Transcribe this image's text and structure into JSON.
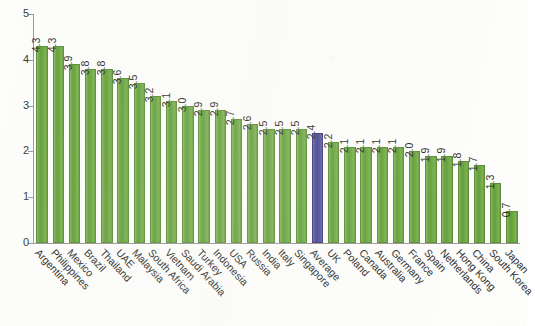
{
  "chart_data": {
    "type": "bar",
    "title": "",
    "subtitle": "",
    "xlabel": "",
    "ylabel": "",
    "ylim": [
      0,
      5
    ],
    "yticks": [
      "0",
      "1",
      "2",
      "3",
      "4",
      "5"
    ],
    "grid": false,
    "legend": "none",
    "categories": [
      "Argentina",
      "Philippines",
      "Mexico",
      "Brazil",
      "Thailand",
      "UAE",
      "Malaysia",
      "South Africa",
      "Vietnam",
      "Saudi Arabia",
      "Turkey",
      "Indonesia",
      "USA",
      "Russia",
      "India",
      "Italy",
      "Singapore",
      "Average",
      "UK",
      "Poland",
      "Canada",
      "Australia",
      "Germany",
      "France",
      "Spain",
      "Netherlands",
      "Hong Kong",
      "China",
      "South Korea",
      "Japan"
    ],
    "values": [
      4.3,
      4.3,
      3.9,
      3.8,
      3.8,
      3.6,
      3.5,
      3.2,
      3.1,
      3.0,
      2.9,
      2.9,
      2.7,
      2.6,
      2.5,
      2.5,
      2.5,
      2.4,
      2.2,
      2.1,
      2.1,
      2.1,
      2.1,
      2.0,
      1.9,
      1.9,
      1.8,
      1.7,
      1.3,
      0.7
    ],
    "value_labels": [
      "4.3",
      "4.3",
      "3.9",
      "3.8",
      "3.8",
      "3.6",
      "3.5",
      "3.2",
      "3.1",
      "3.0",
      "2.9",
      "2.9",
      "2.7",
      "2.6",
      "2.5",
      "2.5",
      "2.5",
      "2.4",
      "2.2",
      "2.1",
      "2.1",
      "2.1",
      "2.1",
      "2.0",
      "1.9",
      "1.9",
      "1.8",
      "1.7",
      "1.3",
      "0.7"
    ],
    "highlight_category": "Average",
    "colors": {
      "bar": "#69a53e",
      "bar_border": "#5d8f3b",
      "highlight_bar": "#4a4a9e",
      "highlight_bar_border": "#3b3b78",
      "axis": "#9a9a93",
      "text": "#2f2f2d",
      "background": "#fdfdfb"
    }
  }
}
